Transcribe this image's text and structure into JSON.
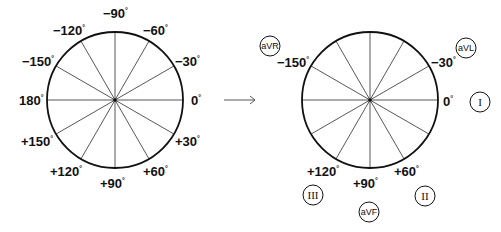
{
  "diagram": {
    "left_panel": {
      "center": [
        115,
        100
      ],
      "radius": 68,
      "angle_labels": [
        {
          "text": "−90",
          "x": 103,
          "y": 18
        },
        {
          "text": "−60",
          "x": 143,
          "y": 35
        },
        {
          "text": "−30",
          "x": 175,
          "y": 66
        },
        {
          "text": "0",
          "x": 191,
          "y": 105
        },
        {
          "text": "+30",
          "x": 175,
          "y": 146
        },
        {
          "text": "+60",
          "x": 143,
          "y": 176
        },
        {
          "text": "+90",
          "x": 100,
          "y": 188
        },
        {
          "text": "+120",
          "x": 50,
          "y": 176
        },
        {
          "text": "+150",
          "x": 21,
          "y": 146
        },
        {
          "text": "180",
          "x": 19,
          "y": 105
        },
        {
          "text": "−150",
          "x": 22,
          "y": 66
        },
        {
          "text": "−120",
          "x": 53,
          "y": 35
        }
      ]
    },
    "arrow": {
      "x1": 224,
      "x2": 255,
      "y": 100
    },
    "right_panel": {
      "center": [
        370,
        100
      ],
      "radius": 68,
      "angle_labels": [
        {
          "text": "−150",
          "x": 277,
          "y": 67
        },
        {
          "text": "−30",
          "x": 431,
          "y": 67
        },
        {
          "text": "0",
          "x": 443,
          "y": 106
        },
        {
          "text": "+120",
          "x": 307,
          "y": 176
        },
        {
          "text": "+90",
          "x": 353,
          "y": 188
        },
        {
          "text": "+60",
          "x": 394,
          "y": 176
        }
      ],
      "leads": [
        {
          "name": "aVR",
          "x": 270,
          "y": 46,
          "style": "sans"
        },
        {
          "name": "aVL",
          "x": 466,
          "y": 48,
          "style": "sans"
        },
        {
          "name": "I",
          "x": 480,
          "y": 102,
          "style": "roman"
        },
        {
          "name": "II",
          "x": 425,
          "y": 196,
          "style": "roman"
        },
        {
          "name": "III",
          "x": 313,
          "y": 195,
          "style": "roman"
        },
        {
          "name": "aVF",
          "x": 369,
          "y": 212,
          "style": "sans"
        }
      ]
    },
    "degree_symbol": "°",
    "colors": {
      "stroke": "#111111",
      "spoke": "#444444",
      "background": "#ffffff"
    }
  }
}
